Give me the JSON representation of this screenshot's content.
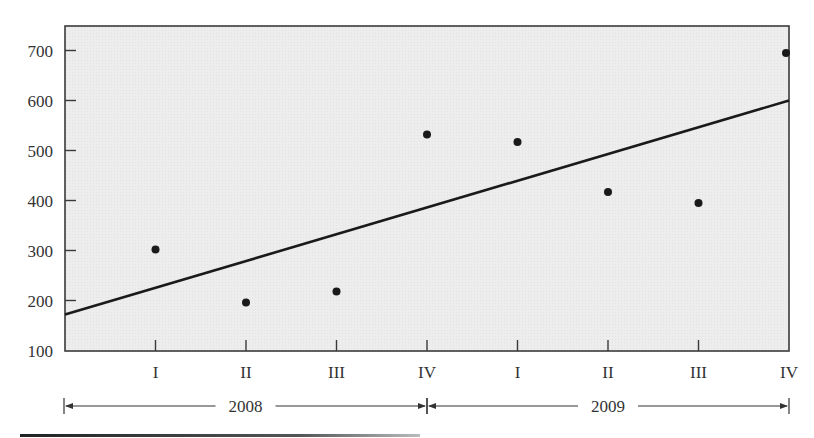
{
  "chart_data": {
    "type": "scatter",
    "title": "",
    "xlabel": "",
    "ylabel": "",
    "ylim": [
      100,
      700
    ],
    "y_ticks": [
      100,
      200,
      300,
      400,
      500,
      600,
      700
    ],
    "y_tick_labels": [
      "100",
      "200",
      "300",
      "400",
      "500",
      "600",
      "700"
    ],
    "categories": [
      "I",
      "II",
      "III",
      "IV",
      "I",
      "II",
      "III",
      "IV"
    ],
    "year_groups": [
      {
        "label": "2008",
        "quarters": [
          "I",
          "II",
          "III",
          "IV"
        ]
      },
      {
        "label": "2009",
        "quarters": [
          "I",
          "II",
          "III",
          "IV"
        ]
      }
    ],
    "series": [
      {
        "name": "Quarterly values",
        "type": "scatter",
        "values": [
          302,
          196,
          218,
          532,
          517,
          417,
          395,
          695
        ]
      },
      {
        "name": "Trend line",
        "type": "line",
        "start": {
          "x_index": 0,
          "value": 172
        },
        "end": {
          "x_index": 8,
          "value": 600
        }
      }
    ],
    "grid": false,
    "legend": "none",
    "plot_background": "#ececec"
  },
  "axes": {
    "y_labels": [
      "700",
      "600",
      "500",
      "400",
      "300",
      "200",
      "100"
    ],
    "x_labels": [
      "I",
      "II",
      "III",
      "IV",
      "I",
      "II",
      "III",
      "IV"
    ],
    "years": [
      "2008",
      "2009"
    ]
  }
}
